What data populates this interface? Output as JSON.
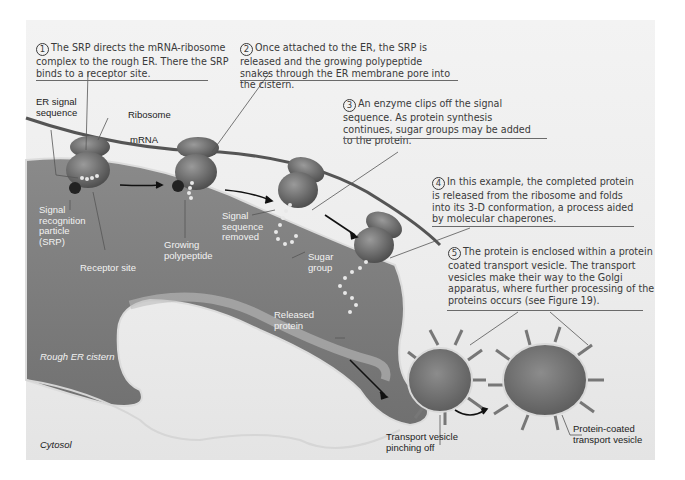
{
  "steps": [
    {
      "number": "1",
      "text": "The SRP directs the mRNA-ribosome complex to the rough ER. There the SRP binds to a receptor site."
    },
    {
      "number": "2",
      "text": "Once attached to the ER, the SRP is released and the growing polypeptide snakes through the ER membrane pore into the cistern."
    },
    {
      "number": "3",
      "text": "An enzyme clips off the signal sequence. As protein synthesis continues, sugar groups may be added to the protein."
    },
    {
      "number": "4",
      "text": "In this example, the completed protein is released from the ribosome and folds into its 3-D conformation, a process aided by molecular chaperones."
    },
    {
      "number": "5",
      "text": "The protein is enclosed within a protein coated transport vesicle. The transport vesicles make their way to the Golgi apparatus, where further processing of the proteins occurs (see Figure 19)."
    }
  ],
  "labels": {
    "er_signal_sequence": "ER signal sequence",
    "ribosome": "Ribosome",
    "mrna": "mRNA",
    "srp": "Signal recognition particle (SRP)",
    "receptor_site": "Receptor site",
    "growing_polypeptide": "Growing polypeptide",
    "signal_sequence_removed": "Signal sequence removed",
    "sugar_group": "Sugar group",
    "released_protein": "Released protein",
    "rough_er_cistern": "Rough ER cistern",
    "cytosol": "Cytosol",
    "transport_vesicle_pinching_off": "Transport vesicle pinching off",
    "protein_coated_transport_vesicle": "Protein-coated transport vesicle"
  },
  "colors": {
    "cistern": "#7e7e7e",
    "ribosome": "#6a6a6a",
    "background": "#ededed",
    "text": "#3a3a3a"
  }
}
